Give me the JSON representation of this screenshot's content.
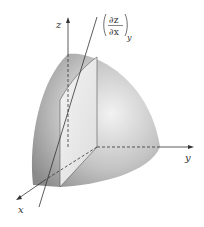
{
  "diagram": {
    "type": "3d-octant-sphere-with-tangent-line",
    "axes": {
      "x_label": "x",
      "y_label": "y",
      "z_label": "z"
    },
    "tangent_label": {
      "numerator": "∂z",
      "denominator": "∂x",
      "subscript": "y"
    },
    "colors": {
      "surface_dark": "#8c8c8c",
      "surface_light": "#e6e6e6",
      "plane_fill": "#ececec",
      "line": "#333333"
    }
  }
}
